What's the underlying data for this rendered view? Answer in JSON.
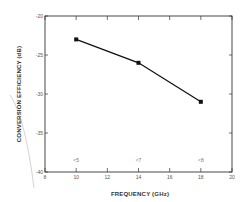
{
  "chart_data": {
    "type": "line",
    "title": "",
    "xlabel": "FREQUENCY (GHz)",
    "ylabel": "CONVERSION EFFICIENCY (dB)",
    "xlim": [
      8,
      20
    ],
    "ylim": [
      -40,
      -20
    ],
    "x_ticks": [
      8,
      10,
      12,
      14,
      16,
      18,
      20
    ],
    "y_ticks": [
      -20,
      -25,
      -30,
      -35,
      -40
    ],
    "x_tick_labels": [
      "8",
      "10",
      "12",
      "14",
      "16",
      "18",
      "20"
    ],
    "y_tick_labels": [
      "-20",
      "-25",
      "-30",
      "-35",
      "-40"
    ],
    "grid": false,
    "legend": null,
    "series": [
      {
        "name": "Conversion efficiency",
        "x": [
          10,
          14,
          18
        ],
        "y": [
          -23,
          -26,
          -31
        ],
        "marker": "square",
        "color": "#111111"
      }
    ],
    "annotations": [
      {
        "x": 10,
        "y": -39,
        "text": "<5"
      },
      {
        "x": 14,
        "y": -39,
        "text": "<7"
      },
      {
        "x": 18,
        "y": -39,
        "text": "<8"
      }
    ]
  },
  "colors": {
    "axis": "#333333",
    "line": "#111111",
    "marker": "#111111",
    "artifact": "#bbbbbb"
  }
}
